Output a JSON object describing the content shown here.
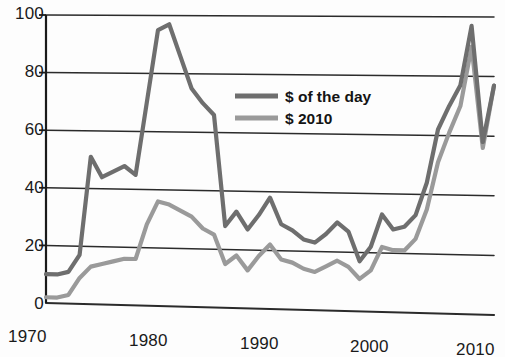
{
  "chart_data": {
    "type": "line",
    "title": "",
    "subtitle": "",
    "xlabel": "",
    "ylabel": "",
    "xlim": [
      1970,
      2010
    ],
    "ylim": [
      0,
      100
    ],
    "grid": true,
    "grid_axis": "y",
    "legend_position": "inside-top-center",
    "x_ticks": [
      "1970",
      "1980",
      "1990",
      "2000",
      "2010"
    ],
    "x_tick_values": [
      1970,
      1980,
      1990,
      2000,
      2010
    ],
    "y_ticks": [
      "0",
      "20",
      "40",
      "60",
      "80",
      "100"
    ],
    "y_tick_values": [
      0,
      20,
      40,
      60,
      80,
      100
    ],
    "x": [
      1970,
      1971,
      1972,
      1973,
      1974,
      1975,
      1976,
      1977,
      1978,
      1979,
      1980,
      1981,
      1982,
      1983,
      1984,
      1985,
      1986,
      1987,
      1988,
      1989,
      1990,
      1991,
      1992,
      1993,
      1994,
      1995,
      1996,
      1997,
      1998,
      1999,
      2000,
      2001,
      2002,
      2003,
      2004,
      2005,
      2006,
      2007,
      2008,
      2009,
      2010
    ],
    "series": [
      {
        "name": "$ of the day",
        "color": "#6e6e6e",
        "values": [
          10,
          10,
          11,
          17,
          51,
          44,
          46,
          48,
          45,
          70,
          95,
          97,
          86,
          75,
          70,
          66,
          28,
          33,
          27,
          32,
          38,
          29,
          27,
          24,
          23,
          26,
          30,
          27,
          17,
          22,
          33,
          28,
          29,
          33,
          44,
          62,
          70,
          77,
          97,
          58,
          77
        ]
      },
      {
        "name": "$ 2010",
        "color": "#9a9a9a",
        "values": [
          2,
          2,
          3,
          9,
          13,
          14,
          15,
          16,
          16,
          28,
          36,
          35,
          33,
          31,
          27,
          25,
          15,
          18,
          13,
          18,
          22,
          17,
          16,
          14,
          13,
          15,
          17,
          15,
          11,
          14,
          22,
          21,
          21,
          25,
          35,
          51,
          61,
          70,
          90,
          56,
          77
        ]
      }
    ]
  },
  "legend": {
    "entries": [
      {
        "label": "$ of the day",
        "color": "#6e6e6e"
      },
      {
        "label": "$ 2010",
        "color": "#9a9a9a"
      }
    ]
  },
  "axis": {
    "y_labels": [
      "100",
      "80",
      "60",
      "40",
      "20",
      "0"
    ],
    "x_labels": [
      "1970",
      "1980",
      "1990",
      "2000",
      "2010"
    ]
  },
  "colors": {
    "series_nominal": "#6e6e6e",
    "series_real": "#9a9a9a",
    "axis": "#1a1a1a",
    "grid": "#2b2b2b",
    "background": "#fdfdfd"
  }
}
